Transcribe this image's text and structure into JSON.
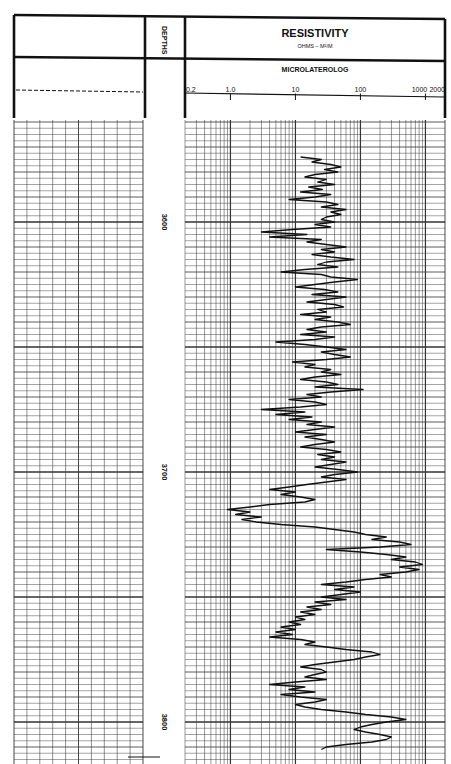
{
  "header": {
    "depths_label": "DEPTHS",
    "track_title": "RESISTIVITY",
    "track_units": "OHMS – M²/M",
    "curve_name": "MICROLATEROLOG",
    "scale_labels": [
      "0.2",
      "1.0",
      "10",
      "100",
      "1000",
      "2000"
    ]
  },
  "depth_labels": [
    "3600",
    "3700",
    "3800"
  ],
  "colors": {
    "ink": "#111111",
    "grid": "#333333",
    "paper": "#ffffff"
  },
  "chart_data": {
    "type": "line",
    "xlabel": "Resistivity (ohm-m), logarithmic",
    "ylabel": "Depth",
    "x_scale": "log",
    "xlim": [
      0.2,
      2000
    ],
    "x_ticks": [
      0.2,
      1.0,
      10,
      100,
      1000,
      2000
    ],
    "ylim": [
      3560,
      3815
    ],
    "y_ticks": [
      3600,
      3700,
      3800
    ],
    "grid": true,
    "legend": null,
    "series": [
      {
        "name": "Microlaterolog",
        "points": [
          [
            3574,
            12
          ],
          [
            3575,
            25
          ],
          [
            3576,
            18
          ],
          [
            3577,
            35
          ],
          [
            3578,
            50
          ],
          [
            3579,
            28
          ],
          [
            3580,
            45
          ],
          [
            3581,
            20
          ],
          [
            3582,
            14
          ],
          [
            3583,
            30
          ],
          [
            3584,
            22
          ],
          [
            3585,
            40
          ],
          [
            3586,
            16
          ],
          [
            3587,
            26
          ],
          [
            3588,
            12
          ],
          [
            3589,
            35
          ],
          [
            3590,
            20
          ],
          [
            3591,
            8
          ],
          [
            3592,
            30
          ],
          [
            3593,
            45
          ],
          [
            3594,
            25
          ],
          [
            3595,
            60
          ],
          [
            3596,
            35
          ],
          [
            3597,
            50
          ],
          [
            3598,
            30
          ],
          [
            3599,
            25
          ],
          [
            3600,
            40
          ],
          [
            3601,
            20
          ],
          [
            3602,
            35
          ],
          [
            3603,
            9
          ],
          [
            3604,
            3
          ],
          [
            3605,
            15
          ],
          [
            3606,
            4
          ],
          [
            3607,
            25
          ],
          [
            3608,
            15
          ],
          [
            3609,
            30
          ],
          [
            3610,
            60
          ],
          [
            3611,
            25
          ],
          [
            3612,
            40
          ],
          [
            3613,
            18
          ],
          [
            3614,
            35
          ],
          [
            3615,
            80
          ],
          [
            3616,
            30
          ],
          [
            3617,
            22
          ],
          [
            3618,
            45
          ],
          [
            3619,
            14
          ],
          [
            3620,
            6
          ],
          [
            3621,
            25
          ],
          [
            3622,
            35
          ],
          [
            3623,
            90
          ],
          [
            3624,
            40
          ],
          [
            3625,
            20
          ],
          [
            3626,
            10
          ],
          [
            3627,
            28
          ],
          [
            3628,
            45
          ],
          [
            3629,
            18
          ],
          [
            3630,
            60
          ],
          [
            3631,
            30
          ],
          [
            3632,
            15
          ],
          [
            3633,
            40
          ],
          [
            3634,
            55
          ],
          [
            3635,
            22
          ],
          [
            3636,
            30
          ],
          [
            3637,
            12
          ],
          [
            3638,
            35
          ],
          [
            3639,
            20
          ],
          [
            3640,
            45
          ],
          [
            3641,
            70
          ],
          [
            3642,
            25
          ],
          [
            3643,
            15
          ],
          [
            3644,
            30
          ],
          [
            3645,
            12
          ],
          [
            3646,
            40
          ],
          [
            3647,
            20
          ],
          [
            3648,
            5
          ],
          [
            3649,
            14
          ],
          [
            3650,
            30
          ],
          [
            3651,
            60
          ],
          [
            3652,
            25
          ],
          [
            3653,
            40
          ],
          [
            3654,
            70
          ],
          [
            3655,
            30
          ],
          [
            3656,
            9
          ],
          [
            3657,
            20
          ],
          [
            3658,
            14
          ],
          [
            3659,
            35
          ],
          [
            3660,
            25
          ],
          [
            3661,
            50
          ],
          [
            3662,
            20
          ],
          [
            3663,
            12
          ],
          [
            3664,
            30
          ],
          [
            3665,
            45
          ],
          [
            3666,
            20
          ],
          [
            3667,
            110
          ],
          [
            3668,
            35
          ],
          [
            3669,
            15
          ],
          [
            3670,
            25
          ],
          [
            3671,
            8
          ],
          [
            3672,
            20
          ],
          [
            3673,
            30
          ],
          [
            3674,
            12
          ],
          [
            3675,
            3
          ],
          [
            3676,
            14
          ],
          [
            3677,
            5
          ],
          [
            3678,
            18
          ],
          [
            3679,
            8
          ],
          [
            3680,
            25
          ],
          [
            3681,
            15
          ],
          [
            3682,
            40
          ],
          [
            3683,
            20
          ],
          [
            3684,
            10
          ],
          [
            3685,
            30
          ],
          [
            3686,
            14
          ],
          [
            3687,
            25
          ],
          [
            3688,
            40
          ],
          [
            3689,
            20
          ],
          [
            3690,
            12
          ],
          [
            3691,
            30
          ],
          [
            3692,
            50
          ],
          [
            3693,
            22
          ],
          [
            3694,
            40
          ],
          [
            3695,
            25
          ],
          [
            3696,
            60
          ],
          [
            3697,
            35
          ],
          [
            3698,
            20
          ],
          [
            3699,
            45
          ],
          [
            3700,
            90
          ],
          [
            3701,
            40
          ],
          [
            3702,
            25
          ],
          [
            3703,
            60
          ],
          [
            3704,
            30
          ],
          [
            3705,
            15
          ],
          [
            3706,
            8
          ],
          [
            3707,
            4
          ],
          [
            3708,
            10
          ],
          [
            3709,
            6
          ],
          [
            3710,
            12
          ],
          [
            3711,
            20
          ],
          [
            3712,
            14
          ],
          [
            3713,
            4
          ],
          [
            3714,
            2
          ],
          [
            3715,
            0.9
          ],
          [
            3716,
            2
          ],
          [
            3717,
            1.2
          ],
          [
            3718,
            3
          ],
          [
            3719,
            1.5
          ],
          [
            3720,
            2.5
          ],
          [
            3721,
            6
          ],
          [
            3722,
            20
          ],
          [
            3723,
            40
          ],
          [
            3724,
            80
          ],
          [
            3725,
            120
          ],
          [
            3726,
            250
          ],
          [
            3727,
            150
          ],
          [
            3728,
            400
          ],
          [
            3729,
            600
          ],
          [
            3730,
            200
          ],
          [
            3731,
            30
          ],
          [
            3732,
            100
          ],
          [
            3733,
            250
          ],
          [
            3734,
            500
          ],
          [
            3735,
            300
          ],
          [
            3736,
            700
          ],
          [
            3737,
            900
          ],
          [
            3738,
            400
          ],
          [
            3739,
            800
          ],
          [
            3740,
            500
          ],
          [
            3741,
            200
          ],
          [
            3742,
            300
          ],
          [
            3743,
            120
          ],
          [
            3744,
            60
          ],
          [
            3745,
            25
          ],
          [
            3746,
            80
          ],
          [
            3747,
            40
          ],
          [
            3748,
            100
          ],
          [
            3749,
            50
          ],
          [
            3750,
            25
          ],
          [
            3751,
            60
          ],
          [
            3752,
            20
          ],
          [
            3753,
            35
          ],
          [
            3754,
            15
          ],
          [
            3755,
            25
          ],
          [
            3756,
            12
          ],
          [
            3757,
            20
          ],
          [
            3758,
            10
          ],
          [
            3759,
            14
          ],
          [
            3760,
            8
          ],
          [
            3761,
            12
          ],
          [
            3762,
            6
          ],
          [
            3763,
            10
          ],
          [
            3764,
            5
          ],
          [
            3765,
            9
          ],
          [
            3766,
            4
          ],
          [
            3767,
            12
          ],
          [
            3768,
            20
          ],
          [
            3769,
            14
          ],
          [
            3770,
            30
          ],
          [
            3771,
            60
          ],
          [
            3772,
            150
          ],
          [
            3773,
            200
          ],
          [
            3774,
            120
          ],
          [
            3775,
            80
          ],
          [
            3776,
            40
          ],
          [
            3777,
            20
          ],
          [
            3778,
            12
          ],
          [
            3779,
            25
          ],
          [
            3780,
            30
          ],
          [
            3781,
            20
          ],
          [
            3782,
            14
          ],
          [
            3783,
            30
          ],
          [
            3784,
            10
          ],
          [
            3785,
            4
          ],
          [
            3786,
            14
          ],
          [
            3787,
            8
          ],
          [
            3788,
            20
          ],
          [
            3789,
            6
          ],
          [
            3790,
            12
          ],
          [
            3791,
            30
          ],
          [
            3792,
            20
          ],
          [
            3793,
            10
          ],
          [
            3794,
            14
          ],
          [
            3795,
            25
          ],
          [
            3796,
            60
          ],
          [
            3797,
            120
          ],
          [
            3798,
            300
          ],
          [
            3799,
            500
          ],
          [
            3800,
            250
          ],
          [
            3801,
            150
          ],
          [
            3802,
            100
          ],
          [
            3803,
            80
          ],
          [
            3804,
            120
          ],
          [
            3805,
            200
          ],
          [
            3806,
            300
          ],
          [
            3807,
            250
          ],
          [
            3808,
            150
          ],
          [
            3809,
            60
          ],
          [
            3810,
            30
          ],
          [
            3811,
            25
          ]
        ]
      }
    ]
  }
}
